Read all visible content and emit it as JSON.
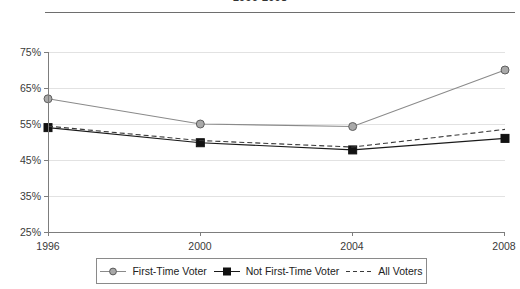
{
  "chart_title": "1996-2008",
  "chart_data": {
    "type": "line",
    "title": "1996-2008",
    "xlabel": "",
    "ylabel": "",
    "categories": [
      "1996",
      "2000",
      "2004",
      "2008"
    ],
    "x": [
      1996,
      2000,
      2004,
      2008
    ],
    "ylim": [
      25,
      75
    ],
    "yticks": [
      25,
      35,
      45,
      55,
      65,
      75
    ],
    "ytick_labels": [
      "25%",
      "35%",
      "45%",
      "55%",
      "65%",
      "75%"
    ],
    "grid": true,
    "legend_position": "bottom",
    "series": [
      {
        "name": "First-Time Voter",
        "marker": "circle",
        "line_style": "solid",
        "color": "#8a8a8a",
        "values": [
          62.0,
          55.0,
          54.3,
          70.0
        ]
      },
      {
        "name": "Not First-Time Voter",
        "marker": "square",
        "line_style": "solid",
        "color": "#1a1a1a",
        "values": [
          54.0,
          49.8,
          47.8,
          51.0
        ]
      },
      {
        "name": "All Voters",
        "marker": "none",
        "line_style": "dashed",
        "color": "#3a3a3a",
        "values": [
          54.4,
          50.4,
          48.6,
          53.5
        ]
      }
    ]
  },
  "axis": {
    "y_labels": [
      "75%",
      "65%",
      "55%",
      "45%",
      "35%",
      "25%"
    ],
    "x_labels": [
      "1996",
      "2000",
      "2004",
      "2008"
    ]
  },
  "legend": {
    "items": [
      {
        "label": "First-Time Voter",
        "icon": "circle-marker-line-icon"
      },
      {
        "label": "Not First-Time Voter",
        "icon": "square-marker-line-icon"
      },
      {
        "label": "All Voters",
        "icon": "dashed-line-icon"
      }
    ]
  }
}
